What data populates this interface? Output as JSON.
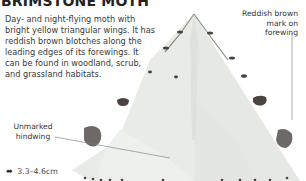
{
  "header": {
    "title": "BRIMSTONE MOTH"
  },
  "description": "Day- and night-flying moth with bright yellow triangular wings. It has reddish brown blotches along the leading edges of its forewings. It can be found in woodland, scrub, and grassland habitats.",
  "annotations": {
    "forewing_mark": "Reddish brown mark on forewing",
    "hindwing": "Unmarked hindwing"
  },
  "size": {
    "icon": "double-arrow-icon",
    "icon_glyph": "⬌",
    "value": "3.3–4.6cm"
  },
  "colors": {
    "wing": "#e9ece6",
    "mark": "#4a4340",
    "text": "#3a3a3a"
  }
}
